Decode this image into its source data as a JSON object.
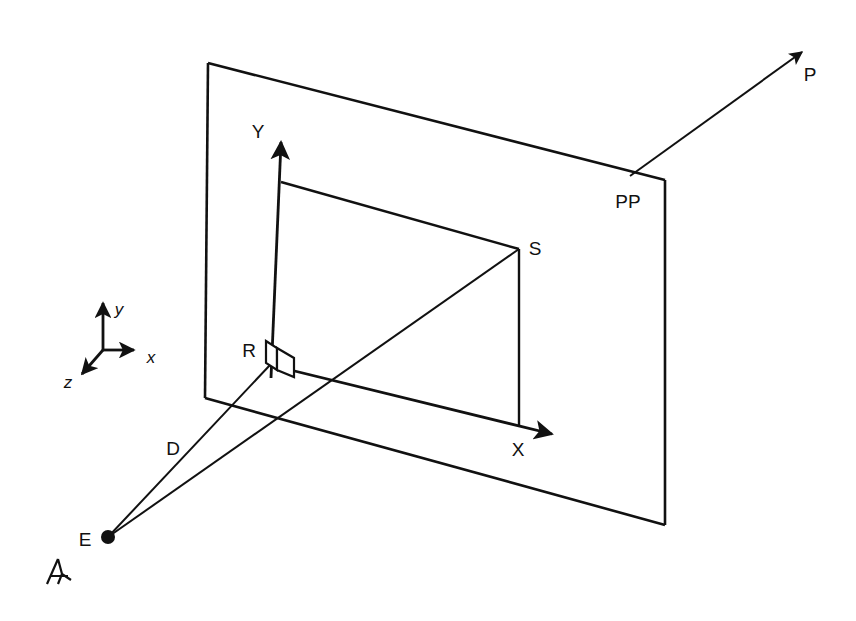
{
  "figure": {
    "background_color": "#ffffff",
    "ink_color": "#111111",
    "width": 856,
    "height": 621
  },
  "labels": {
    "picture_plane": "PP",
    "projector_point": "P",
    "screen_point": "S",
    "reference_origin": "R",
    "distance": "D",
    "eye": "E",
    "axis_x_upper": "X",
    "axis_y_upper": "Y",
    "axis_x_lower": "x",
    "axis_y_lower": "y",
    "axis_z_lower": "z"
  },
  "geometry": {
    "picture_plane": {
      "top_left": [
        208,
        63
      ],
      "top_right": [
        665,
        180
      ],
      "bottom_right": [
        665,
        525
      ],
      "bottom_left": [
        205,
        398
      ]
    },
    "screen_axes": {
      "origin_R": [
        270,
        365
      ],
      "y_axis_tip": [
        281,
        136
      ],
      "x_axis_tip": [
        560,
        437
      ]
    },
    "point_S": [
      519,
      249
    ],
    "rect_top_left": [
      281,
      182
    ],
    "rect_bottom_on_x": [
      519,
      425
    ],
    "eye_E": [
      108,
      537
    ],
    "ray_P_tip": [
      810,
      45
    ],
    "ray_P_origin": [
      630,
      176
    ],
    "triad_origin": [
      103,
      350
    ]
  }
}
